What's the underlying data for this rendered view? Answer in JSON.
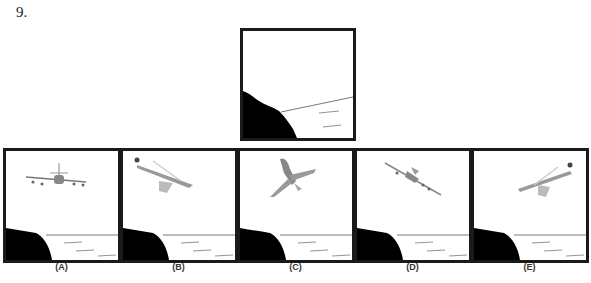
{
  "question": {
    "number": "9."
  },
  "problem_figure": {
    "description": "cliff-and-sea scene, mirrored view"
  },
  "options": [
    {
      "label": "(A)",
      "plane": "front-view"
    },
    {
      "label": "(B)",
      "plane": "banking-left"
    },
    {
      "label": "(C)",
      "plane": "top-view-climbing"
    },
    {
      "label": "(D)",
      "plane": "banking-right"
    },
    {
      "label": "(E)",
      "plane": "banking-left-mirrored"
    }
  ]
}
